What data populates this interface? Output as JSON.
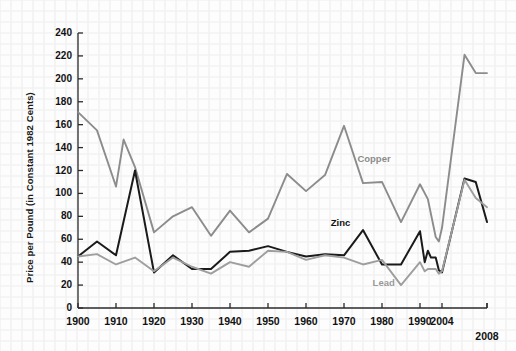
{
  "figure": {
    "background_color": "#fdfdfd",
    "grid_color": "#f2f2f2",
    "axis_color": "#2b2b2b"
  },
  "axes": {
    "y_title": "Price per Pound (in Constant 1982 Cents)",
    "y_ticks": [
      0,
      20,
      40,
      60,
      80,
      100,
      120,
      140,
      160,
      180,
      200,
      220,
      240
    ],
    "y_tick_labels": [
      "0",
      "20",
      "40",
      "60",
      "80",
      "100",
      "120",
      "140",
      "160",
      "180",
      "200",
      "220",
      "240"
    ],
    "x_tick_labels": [
      "1900",
      "1910",
      "1920",
      "1930",
      "1940",
      "1950",
      "1960",
      "1970",
      "1980",
      "1990",
      "2004",
      "2008"
    ],
    "x_tick_values": [
      1900,
      1910,
      1920,
      1930,
      1940,
      1950,
      1960,
      1970,
      1980,
      1990,
      2004,
      2008
    ]
  },
  "series_labels": {
    "copper": "Copper",
    "zinc": "Zinc",
    "lead": "Lead"
  },
  "chart_data": {
    "type": "line",
    "title": "",
    "xlabel": "",
    "ylabel": "Price per Pound (in Constant 1982 Cents)",
    "xlim": [
      1900,
      2008
    ],
    "ylim": [
      0,
      240
    ],
    "grid": true,
    "legend": "inline-annotations",
    "colors": {
      "copper": "#8c8c8c",
      "zinc": "#1a1a1a",
      "lead": "#9e9e9e"
    },
    "series": [
      {
        "name": "Copper",
        "color": "#8c8c8c",
        "x": [
          1900,
          1905,
          1910,
          1912,
          1915,
          1920,
          1925,
          1930,
          1935,
          1940,
          1945,
          1950,
          1955,
          1960,
          1965,
          1970,
          1975,
          1980,
          1985,
          1990,
          1995,
          2000,
          2002,
          2004,
          2006,
          2007,
          2008
        ],
        "values": [
          171,
          155,
          106,
          147,
          123,
          66,
          80,
          88,
          63,
          85,
          66,
          78,
          117,
          102,
          116,
          159,
          109,
          110,
          75,
          108,
          95,
          62,
          58,
          70,
          221,
          205,
          205
        ]
      },
      {
        "name": "Zinc",
        "color": "#1a1a1a",
        "x": [
          1900,
          1905,
          1910,
          1915,
          1920,
          1925,
          1930,
          1935,
          1940,
          1945,
          1950,
          1955,
          1960,
          1965,
          1970,
          1975,
          1980,
          1985,
          1990,
          1993,
          1995,
          1997,
          2000,
          2002,
          2004,
          2006,
          2007,
          2008
        ],
        "values": [
          45,
          58,
          46,
          120,
          31,
          46,
          34,
          34,
          49,
          50,
          54,
          49,
          45,
          47,
          46,
          68,
          38,
          38,
          67,
          40,
          50,
          44,
          44,
          33,
          31,
          113,
          110,
          75
        ]
      },
      {
        "name": "Lead",
        "color": "#9e9e9e",
        "x": [
          1900,
          1905,
          1910,
          1915,
          1920,
          1925,
          1930,
          1935,
          1940,
          1945,
          1950,
          1955,
          1960,
          1965,
          1970,
          1975,
          1980,
          1985,
          1990,
          1993,
          1995,
          2000,
          2002,
          2004,
          2006,
          2007,
          2008
        ],
        "values": [
          45,
          47,
          38,
          44,
          32,
          44,
          36,
          30,
          40,
          36,
          50,
          49,
          42,
          46,
          44,
          38,
          42,
          20,
          40,
          32,
          34,
          34,
          30,
          32,
          112,
          96,
          88
        ]
      }
    ],
    "annotations": [
      {
        "text": "Copper",
        "x": 1978,
        "y": 130
      },
      {
        "text": "Zinc",
        "x": 1971,
        "y": 74
      },
      {
        "text": "Lead",
        "x": 1982,
        "y": 22
      }
    ]
  }
}
